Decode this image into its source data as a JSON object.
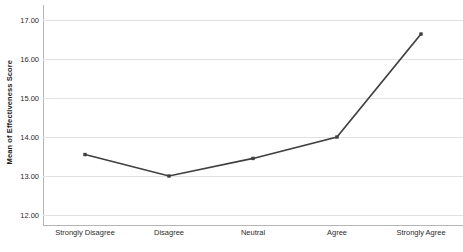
{
  "chart_data": {
    "type": "line",
    "title": "",
    "subtitle": "",
    "xlabel": "",
    "ylabel": "Mean of Effectiveness Score",
    "categories": [
      "Strongly Disagree",
      "Disagree",
      "Neutral",
      "Agree",
      "Strongly Agree"
    ],
    "values": [
      13.55,
      13.0,
      13.45,
      14.0,
      16.64
    ],
    "ylim": [
      12.0,
      17.0
    ],
    "yticks": [
      12.0,
      13.0,
      14.0,
      15.0,
      16.0,
      17.0
    ],
    "ytick_labels": [
      "12.00",
      "13.00",
      "14.00",
      "15.00",
      "16.00",
      "17.00"
    ],
    "grid": "horizontal",
    "legend": "none",
    "series": [
      {
        "name": "Mean of Effectiveness Score",
        "values": [
          13.55,
          13.0,
          13.45,
          14.0,
          16.64
        ],
        "line_color": "#3f3f3f",
        "marker": "square",
        "marker_color": "#3f3f3f"
      }
    ],
    "colors": {
      "background": "#ffffff",
      "gridline": "#e2e2e2",
      "axis": "#b5b5b5",
      "text": "#2b2b2b",
      "series": "#3f3f3f"
    }
  }
}
